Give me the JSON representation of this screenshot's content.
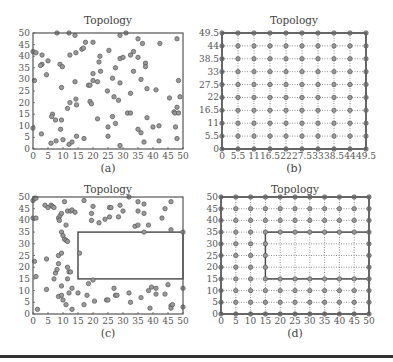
{
  "chart_data": [
    {
      "id": "a",
      "type": "scatter",
      "title": "Topology",
      "caption": "(a)",
      "xlabel": "",
      "ylabel": "",
      "xlim": [
        0,
        50
      ],
      "ylim": [
        0,
        50
      ],
      "xticks": [
        0,
        5,
        10,
        15,
        20,
        25,
        30,
        35,
        40,
        45,
        50
      ],
      "yticks": [
        0,
        5,
        10,
        15,
        20,
        25,
        30,
        35,
        40,
        45,
        50
      ],
      "grid": false,
      "points": [
        [
          0,
          42
        ],
        [
          1,
          41.5
        ],
        [
          3,
          40.5
        ],
        [
          3,
          36.5
        ],
        [
          2.5,
          36
        ],
        [
          5,
          38
        ],
        [
          4.5,
          32
        ],
        [
          0.5,
          29.5
        ],
        [
          0,
          9
        ],
        [
          2.8,
          6.5
        ],
        [
          6,
          2.5
        ],
        [
          7.7,
          3.5
        ],
        [
          9,
          36.5
        ],
        [
          9.8,
          35.5
        ],
        [
          9.5,
          26.5
        ],
        [
          6.5,
          15
        ],
        [
          6.2,
          14
        ],
        [
          7.5,
          12.5
        ],
        [
          9.5,
          12.5
        ],
        [
          9.2,
          8.5
        ],
        [
          10,
          4
        ],
        [
          8,
          50
        ],
        [
          12,
          50
        ],
        [
          14,
          49
        ],
        [
          12.3,
          40.5
        ],
        [
          14.3,
          41.5
        ],
        [
          16.3,
          43
        ],
        [
          16.8,
          43.5
        ],
        [
          17.5,
          46
        ],
        [
          20,
          46
        ],
        [
          14,
          29
        ],
        [
          12.3,
          20
        ],
        [
          11.5,
          17.5
        ],
        [
          14.3,
          21.5
        ],
        [
          14.5,
          19
        ],
        [
          12,
          2
        ],
        [
          13,
          3
        ],
        [
          14.5,
          5.5
        ],
        [
          17,
          4.5
        ],
        [
          19,
          20.5
        ],
        [
          19.5,
          19.5
        ],
        [
          18.5,
          27.5
        ],
        [
          19,
          27.5
        ],
        [
          20,
          29.5
        ],
        [
          20,
          32.5
        ],
        [
          21.5,
          29
        ],
        [
          22,
          37.5
        ],
        [
          22.3,
          40
        ],
        [
          22.5,
          33.5
        ],
        [
          21.5,
          13
        ],
        [
          25.3,
          42.5
        ],
        [
          24.8,
          25
        ],
        [
          26.5,
          30.5
        ],
        [
          27,
          22.5
        ],
        [
          27.5,
          35
        ],
        [
          28.5,
          21
        ],
        [
          26.5,
          14
        ],
        [
          27.5,
          11
        ],
        [
          25,
          9.5
        ],
        [
          25,
          5.5
        ],
        [
          29,
          49
        ],
        [
          31,
          50
        ],
        [
          29,
          39
        ],
        [
          30,
          39.5
        ],
        [
          29,
          28.5
        ],
        [
          29,
          1.5
        ],
        [
          32.5,
          40.5
        ],
        [
          33.5,
          42
        ],
        [
          33.5,
          33.5
        ],
        [
          32.5,
          24
        ],
        [
          31.5,
          15.5
        ],
        [
          32.5,
          15.5
        ],
        [
          35,
          47.5
        ],
        [
          36.5,
          45.5
        ],
        [
          35,
          39.5
        ],
        [
          36,
          30
        ],
        [
          35,
          8.5
        ],
        [
          36,
          7
        ],
        [
          37,
          3
        ],
        [
          37.5,
          37
        ],
        [
          37.5,
          35.5
        ],
        [
          38,
          26
        ],
        [
          38,
          13.5
        ],
        [
          40,
          9.5
        ],
        [
          41,
          25.5
        ],
        [
          42.3,
          45.5
        ],
        [
          42,
          10
        ],
        [
          42,
          3.5
        ],
        [
          45.5,
          22
        ],
        [
          47,
          16
        ],
        [
          47.3,
          15.5
        ],
        [
          47.5,
          9.5
        ],
        [
          48,
          18
        ],
        [
          48,
          47.5
        ],
        [
          48.5,
          29.5
        ],
        [
          49,
          22.5
        ],
        [
          48.5,
          15.5
        ],
        [
          48,
          4.5
        ]
      ]
    },
    {
      "id": "b",
      "type": "scatter",
      "title": "Topology",
      "caption": "(b)",
      "xlabel": "",
      "ylabel": "",
      "xlim": [
        0,
        49.5
      ],
      "ylim": [
        0,
        49.5
      ],
      "xticks": [
        0,
        5.5,
        11,
        16.5,
        22,
        27.5,
        33,
        38.5,
        44,
        49.5
      ],
      "yticks": [
        0,
        5.5,
        11,
        16.5,
        22,
        27.5,
        33,
        38.5,
        44,
        49.5
      ],
      "xtick_labels": [
        "0",
        "5.5",
        "11",
        "16.5",
        "22",
        "27.5",
        "33",
        "38.5",
        "44",
        "49.5"
      ],
      "ytick_labels": [
        "0",
        "5.5",
        "11",
        "16.5",
        "22",
        "27.5",
        "33",
        "38.5",
        "44",
        "49.5"
      ],
      "grid": true,
      "grid_style": "dotted",
      "description": "10x10 perturbed grid of nodes with 5.5 spacing, grid lines connecting neighbors"
    },
    {
      "id": "c",
      "type": "scatter",
      "title": "Topology",
      "caption": "(c)",
      "xlabel": "",
      "ylabel": "",
      "xlim": [
        0,
        50
      ],
      "ylim": [
        0,
        50
      ],
      "xticks": [
        0,
        5,
        10,
        15,
        20,
        25,
        30,
        35,
        40,
        45,
        50
      ],
      "yticks": [
        0,
        5,
        10,
        15,
        20,
        25,
        30,
        35,
        40,
        45,
        50
      ],
      "grid": false,
      "obstacle": {
        "x0": 15,
        "y0": 15,
        "x1": 50,
        "y1": 35
      },
      "points": [
        [
          0,
          48.5
        ],
        [
          0.5,
          49.5
        ],
        [
          1,
          49.5
        ],
        [
          0,
          41
        ],
        [
          1,
          41
        ],
        [
          1,
          16
        ],
        [
          0.5,
          22.5
        ],
        [
          1.5,
          2
        ],
        [
          4,
          46.5
        ],
        [
          5,
          45.5
        ],
        [
          6,
          46.5
        ],
        [
          6.5,
          46
        ],
        [
          7,
          45.5
        ],
        [
          8.5,
          41
        ],
        [
          8.8,
          40
        ],
        [
          9,
          42
        ],
        [
          9.5,
          43
        ],
        [
          8.5,
          25
        ],
        [
          9.5,
          26
        ],
        [
          9.5,
          35
        ],
        [
          10,
          33.5
        ],
        [
          10.5,
          32
        ],
        [
          11,
          31.5
        ],
        [
          11.5,
          31
        ],
        [
          10.5,
          48
        ],
        [
          11.5,
          44
        ],
        [
          12.5,
          44
        ],
        [
          13,
          44.5
        ],
        [
          14,
          43.5
        ],
        [
          11,
          38
        ],
        [
          4.5,
          23.5
        ],
        [
          4.5,
          10.5
        ],
        [
          8.5,
          21.5
        ],
        [
          7.5,
          17.5
        ],
        [
          8,
          19
        ],
        [
          7,
          15
        ],
        [
          9.5,
          12
        ],
        [
          8.5,
          7.5
        ],
        [
          9.5,
          8
        ],
        [
          10,
          6
        ],
        [
          11,
          4
        ],
        [
          11.5,
          20
        ],
        [
          12,
          18
        ],
        [
          12.5,
          18
        ],
        [
          11.5,
          15
        ],
        [
          12,
          9
        ],
        [
          13,
          11
        ],
        [
          13,
          2
        ],
        [
          15,
          9
        ],
        [
          15.5,
          26
        ],
        [
          17,
          48.5
        ],
        [
          17,
          4
        ],
        [
          18,
          8
        ],
        [
          18.5,
          13
        ],
        [
          19.5,
          40
        ],
        [
          19.5,
          43
        ],
        [
          20,
          46
        ],
        [
          20,
          14.5
        ],
        [
          20.5,
          5.5
        ],
        [
          22,
          39
        ],
        [
          24,
          40.5
        ],
        [
          25.5,
          41.5
        ],
        [
          25.5,
          45.5
        ],
        [
          26,
          45.5
        ],
        [
          24.5,
          6
        ],
        [
          25,
          6
        ],
        [
          27,
          11
        ],
        [
          27.5,
          8
        ],
        [
          28,
          8
        ],
        [
          28.5,
          41.5
        ],
        [
          29,
          46.5
        ],
        [
          30,
          44
        ],
        [
          32,
          50
        ],
        [
          32,
          9
        ],
        [
          32.5,
          5
        ],
        [
          34,
          37.5
        ],
        [
          35,
          38
        ],
        [
          35,
          48
        ],
        [
          35,
          44
        ],
        [
          36,
          7
        ],
        [
          37,
          47
        ],
        [
          37,
          43
        ],
        [
          37,
          35
        ],
        [
          38.5,
          38
        ],
        [
          38.5,
          10
        ],
        [
          39,
          2.5
        ],
        [
          39.5,
          11.5
        ],
        [
          41,
          11
        ],
        [
          41,
          8.5
        ],
        [
          43,
          41
        ],
        [
          44,
          45
        ],
        [
          44,
          8.5
        ],
        [
          45,
          12.5
        ],
        [
          46,
          36
        ],
        [
          46,
          48
        ],
        [
          46,
          3.5
        ],
        [
          46,
          2.5
        ],
        [
          46.5,
          4
        ],
        [
          50,
          35
        ],
        [
          50,
          11
        ],
        [
          50,
          3
        ]
      ]
    },
    {
      "id": "d",
      "type": "scatter",
      "title": "Topology",
      "caption": "(d)",
      "xlabel": "",
      "ylabel": "",
      "xlim": [
        0,
        50
      ],
      "ylim": [
        0,
        50
      ],
      "xticks": [
        0,
        5,
        10,
        15,
        20,
        25,
        30,
        35,
        40,
        45,
        50
      ],
      "yticks": [
        0,
        5,
        10,
        15,
        20,
        25,
        30,
        35,
        40,
        45,
        50
      ],
      "grid": true,
      "grid_style": "dotted",
      "grid_spacing": 5,
      "obstacle": {
        "x0": 15,
        "y0": 15,
        "x1": 50,
        "y1": 35
      },
      "description": "11x11 regular grid of nodes with 5 spacing, nodes strictly inside obstacle rectangle removed"
    }
  ],
  "panels": {
    "a": {
      "title": "Topology",
      "caption": "(a)"
    },
    "b": {
      "title": "Topology",
      "caption": "(b)"
    },
    "c": {
      "title": "Topology",
      "caption": "(c)"
    },
    "d": {
      "title": "Topology",
      "caption": "(d)"
    }
  },
  "colors": {
    "axis": "#555555",
    "marker_fill": "#9a9a9a",
    "marker_edge": "#555555",
    "grid": "#777777",
    "rule": "#333333"
  }
}
